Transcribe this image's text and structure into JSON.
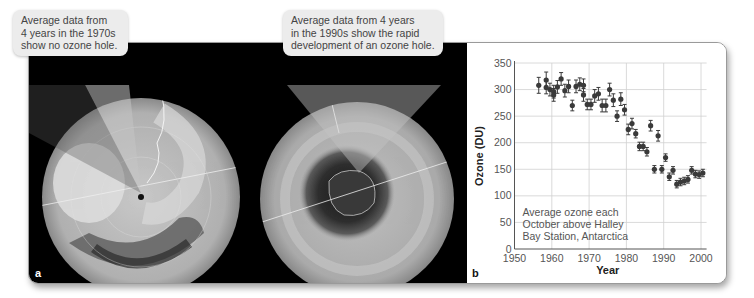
{
  "callouts": {
    "a": "Average data from\n4 years in the 1970s\nshow no ozone hole.",
    "b": "Average data from 4 years\nin the 1990s show the rapid\ndevelopment of an ozone hole."
  },
  "panels": {
    "a_label": "a",
    "b_label": "b"
  },
  "colors": {
    "globe_base": "#b9b9b9",
    "hole": "#333333",
    "points": "#3a3a3a",
    "panel_bg": "#000000",
    "callout_bg": "#ececec",
    "gridline": "#d0d0d0"
  },
  "chart_data": {
    "type": "scatter",
    "title": "",
    "annotation": "Average ozone each\nOctober above Halley\nBay Station, Antarctica",
    "annotation_lines": [
      "Average ozone each",
      "October above Halley",
      "Bay Station, Antarctica"
    ],
    "xlabel": "Year",
    "ylabel": "Ozone (DU)",
    "xlim": [
      1950,
      2001
    ],
    "ylim": [
      0,
      350
    ],
    "xticks": [
      1950,
      1960,
      1970,
      1980,
      1990,
      2000
    ],
    "xtick_labels": [
      "1950",
      "1960",
      "1970",
      "1980",
      "1990",
      "2000"
    ],
    "yticks": [
      0,
      50,
      100,
      150,
      200,
      250,
      300,
      350
    ],
    "ytick_labels": [
      "0",
      "50",
      "100",
      "150",
      "200",
      "250",
      "300",
      "350"
    ],
    "grid": true,
    "error_bars": true,
    "series": [
      {
        "name": "October ozone",
        "x": [
          1956,
          1958,
          1958,
          1959,
          1960,
          1960,
          1961,
          1962,
          1963,
          1964,
          1965,
          1966,
          1967,
          1968,
          1968,
          1969,
          1970,
          1971,
          1972,
          1973,
          1974,
          1975,
          1976,
          1977,
          1978,
          1979,
          1980,
          1981,
          1982,
          1983,
          1984,
          1985,
          1986,
          1987,
          1988,
          1989,
          1990,
          1991,
          1992,
          1993,
          1994,
          1995,
          1996,
          1997,
          1998,
          1999,
          2000
        ],
        "y": [
          308,
          318,
          304,
          300,
          296,
          290,
          305,
          320,
          298,
          306,
          270,
          306,
          310,
          308,
          290,
          272,
          272,
          288,
          292,
          270,
          270,
          300,
          280,
          250,
          282,
          262,
          225,
          236,
          217,
          193,
          193,
          183,
          232,
          150,
          213,
          150,
          172,
          136,
          148,
          122,
          126,
          128,
          131,
          148,
          141,
          140,
          143
        ],
        "err": [
          15,
          15,
          12,
          12,
          12,
          12,
          12,
          12,
          12,
          12,
          10,
          12,
          12,
          12,
          12,
          10,
          10,
          12,
          12,
          12,
          12,
          12,
          12,
          10,
          12,
          10,
          10,
          10,
          8,
          8,
          8,
          8,
          10,
          7,
          10,
          7,
          7,
          7,
          7,
          7,
          7,
          7,
          7,
          7,
          7,
          7,
          7
        ]
      }
    ]
  }
}
